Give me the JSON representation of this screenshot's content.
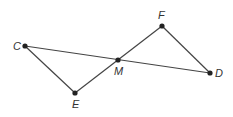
{
  "diagram": {
    "points": [
      {
        "id": "C",
        "x": 25,
        "y": 46,
        "label": "C",
        "lx": 13,
        "ly": 50
      },
      {
        "id": "F",
        "x": 162,
        "y": 26,
        "label": "F",
        "lx": 158,
        "ly": 19
      },
      {
        "id": "M",
        "x": 118,
        "y": 60,
        "label": "M",
        "lx": 114,
        "ly": 75
      },
      {
        "id": "D",
        "x": 210,
        "y": 73,
        "label": "D",
        "lx": 215,
        "ly": 77
      },
      {
        "id": "E",
        "x": 75,
        "y": 93,
        "label": "E",
        "lx": 72,
        "ly": 108
      }
    ],
    "segments": [
      [
        "C",
        "D"
      ],
      [
        "C",
        "E"
      ],
      [
        "E",
        "F"
      ],
      [
        "F",
        "D"
      ]
    ],
    "colors": {
      "line": "#444444",
      "point": "#222222",
      "label": "#333333"
    }
  }
}
